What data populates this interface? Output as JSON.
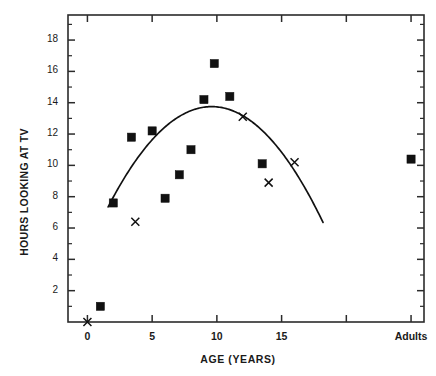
{
  "chart_data": {
    "type": "scatter",
    "title": "",
    "xlabel": "AGE  (YEARS)",
    "ylabel": "HOURS LOOKING AT TV",
    "xlim": [
      -1.5,
      26
    ],
    "ylim": [
      0,
      19.6
    ],
    "grid": false,
    "legend": null,
    "x_ticks": [
      {
        "value": 0,
        "label": "0"
      },
      {
        "value": 5,
        "label": "5"
      },
      {
        "value": 10,
        "label": "10"
      },
      {
        "value": 15,
        "label": "15"
      },
      {
        "value": 20,
        "label": ""
      },
      {
        "value": 25,
        "label": "Adults"
      }
    ],
    "y_ticks": [
      {
        "value": 2,
        "label": "2"
      },
      {
        "value": 4,
        "label": "4"
      },
      {
        "value": 6,
        "label": "6"
      },
      {
        "value": 8,
        "label": "8"
      },
      {
        "value": 10,
        "label": "10"
      },
      {
        "value": 12,
        "label": "12"
      },
      {
        "value": 14,
        "label": "14"
      },
      {
        "value": 16,
        "label": "16"
      },
      {
        "value": 18,
        "label": "18"
      }
    ],
    "y_minor_step": 1,
    "series": [
      {
        "name": "squares",
        "marker": "filled-square",
        "color": "#111111",
        "points": [
          {
            "x": 1.0,
            "y": 1.0
          },
          {
            "x": 2.0,
            "y": 7.6
          },
          {
            "x": 3.4,
            "y": 11.8
          },
          {
            "x": 5.0,
            "y": 12.2
          },
          {
            "x": 6.0,
            "y": 7.9
          },
          {
            "x": 7.1,
            "y": 9.4
          },
          {
            "x": 8.0,
            "y": 11.0
          },
          {
            "x": 9.0,
            "y": 14.2
          },
          {
            "x": 9.8,
            "y": 16.5
          },
          {
            "x": 11.0,
            "y": 14.4
          },
          {
            "x": 13.5,
            "y": 10.1
          },
          {
            "x": 25.0,
            "y": 10.4
          }
        ]
      },
      {
        "name": "crosses",
        "marker": "x",
        "color": "#111111",
        "points": [
          {
            "x": 0.0,
            "y": 0.0
          },
          {
            "x": 3.7,
            "y": 6.4
          },
          {
            "x": 12.0,
            "y": 13.1
          },
          {
            "x": 14.0,
            "y": 8.9
          },
          {
            "x": 16.0,
            "y": 10.2
          }
        ]
      }
    ],
    "fit_curve": {
      "name": "quadratic-fit",
      "type": "parabola",
      "color": "#111111",
      "x_start": 1.6,
      "x_end": 18.2,
      "vertex_x": 9.6,
      "vertex_y": 13.75,
      "curvature": -0.1
    }
  },
  "figure": {
    "caption": ""
  }
}
